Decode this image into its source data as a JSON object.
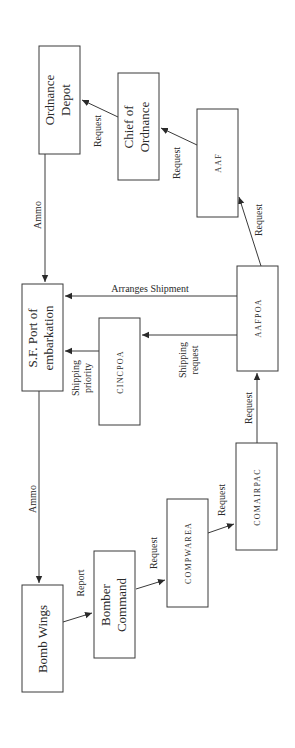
{
  "diagram": {
    "orientation": "rotated 90 degrees counter-clockwise",
    "nodes": {
      "ordnance_depot": [
        "Ordnance",
        "Depot"
      ],
      "chief_of_ordnance": [
        "Chief of",
        "Ordnance"
      ],
      "aaf": [
        "AAF"
      ],
      "sf_port": [
        "S.F. Port of",
        "embarkation"
      ],
      "cincpoa": [
        "CINCPOA"
      ],
      "aafpoa": [
        "AAFPOA"
      ],
      "comairpac": [
        "COMAIRPAC"
      ],
      "compwarea": [
        "COMPWAREA"
      ],
      "bomber_command": [
        "Bomber",
        "Command"
      ],
      "bomb_wings": [
        "Bomb Wings"
      ]
    },
    "edges": {
      "chief_to_depot": [
        "Request"
      ],
      "aaf_to_chief": [
        "Request"
      ],
      "aafpoa_to_aaf": [
        "Request"
      ],
      "depot_to_port": [
        "Ammo"
      ],
      "aafpoa_to_port": [
        "Arranges Shipment"
      ],
      "aafpoa_to_cincpoa": [
        "Shipping",
        "request"
      ],
      "cincpoa_to_port": [
        "Shipping",
        "priority"
      ],
      "comairpac_to_aafpoa": [
        "Request"
      ],
      "compwarea_to_comairpac": [
        "Request"
      ],
      "bomber_to_compwarea": [
        "Request"
      ],
      "wings_to_bomber": [
        "Report"
      ],
      "port_to_wings": [
        "Ammo"
      ]
    }
  }
}
